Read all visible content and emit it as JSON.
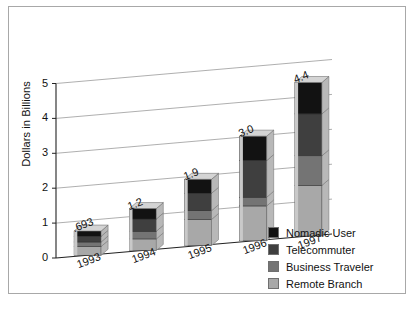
{
  "chart_data": {
    "type": "bar",
    "subtype": "stacked-3d-column",
    "title": "",
    "xlabel": "",
    "ylabel": "Dollars in Billions",
    "categories": [
      "1993",
      "1994",
      "1995",
      "1996",
      "1997"
    ],
    "ylim": [
      0,
      5
    ],
    "yticks": [
      0,
      1,
      2,
      3,
      4,
      5
    ],
    "ytick_labels": [
      "0",
      "1",
      "2",
      "3",
      "4",
      "5"
    ],
    "grid": true,
    "legend_position": "lower-right",
    "series": [
      {
        "name": "Remote Branch",
        "color": "#a8a8a8",
        "values": [
          0.25,
          0.33,
          0.75,
          1.0,
          1.45
        ]
      },
      {
        "name": "Business Traveler",
        "color": "#747474",
        "values": [
          0.13,
          0.22,
          0.25,
          0.25,
          0.85
        ]
      },
      {
        "name": "Telecommuter",
        "color": "#3f3f3f",
        "values": [
          0.163,
          0.35,
          0.5,
          1.05,
          1.2
        ]
      },
      {
        "name": "Nomadic User",
        "color": "#121212",
        "values": [
          0.15,
          0.3,
          0.4,
          0.7,
          0.9
        ]
      }
    ],
    "totals": [
      0.693,
      1.2,
      1.9,
      3.0,
      4.4
    ],
    "total_labels": [
      ".693",
      "1.2",
      "1.9",
      "3.0",
      "4.4"
    ],
    "legend_order_top_to_bottom": [
      "Nomadic User",
      "Telecommuter",
      "Business Traveler",
      "Remote Branch"
    ]
  },
  "legend": {
    "items": [
      {
        "label": "Nomadic User",
        "color": "#121212"
      },
      {
        "label": "Telecommuter",
        "color": "#3f3f3f"
      },
      {
        "label": "Business Traveler",
        "color": "#747474"
      },
      {
        "label": "Remote Branch",
        "color": "#a8a8a8"
      }
    ]
  },
  "colors": {
    "frame_border": "#a8a8a8",
    "gridline": "#9a9a9a",
    "axis": "#222222",
    "background": "#ffffff",
    "bar_top_face": "#d4d4d4",
    "bar_side_face": "#b8b8b8"
  }
}
